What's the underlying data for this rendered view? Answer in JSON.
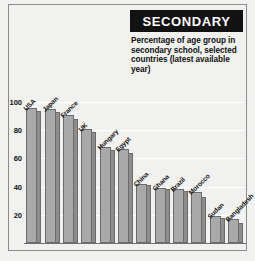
{
  "header": {
    "title": "SECONDARY",
    "subtitle": "Percentage of age group in secondary school, selected countries (latest available year)"
  },
  "colors": {
    "title_background": "#121212",
    "title_text": "#ffffff",
    "panel_background": "#f1f1ef",
    "bar_major": "#a9a9a9",
    "bar_minor": "#8d8d8d",
    "bar_outline": "#6c6c6c",
    "gridline": "#ffffff",
    "axis": "#6f6f6f"
  },
  "chart_data": {
    "type": "bar",
    "title": "SECONDARY",
    "subtitle": "Percentage of age group in secondary school, selected countries (latest available year)",
    "xlabel": "",
    "ylabel": "",
    "ylim": [
      0,
      110
    ],
    "yticks": [
      20,
      40,
      60,
      80,
      100
    ],
    "grid": true,
    "legend": "none",
    "categories": [
      "USA",
      "Japan",
      "France",
      "UK",
      "Hungary",
      "Egypt",
      "China",
      "Ghana",
      "Brazil",
      "Morocco",
      "Sudan",
      "Bangladesh"
    ],
    "series": [
      {
        "name": "Female",
        "values": [
          96,
          95,
          91,
          81,
          68,
          67,
          42,
          39,
          38,
          36,
          19,
          17
        ]
      },
      {
        "name": "Male",
        "values": [
          94,
          93,
          88,
          79,
          66,
          64,
          41,
          38,
          37,
          33,
          18,
          14
        ]
      }
    ]
  }
}
